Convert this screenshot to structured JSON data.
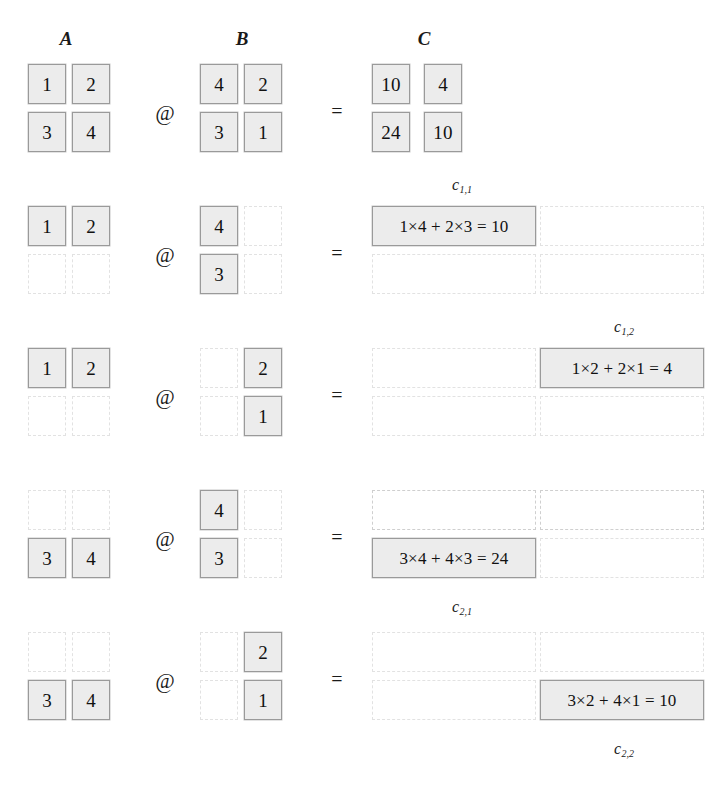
{
  "headers": {
    "a": "A",
    "b": "B",
    "c": "C"
  },
  "operators": {
    "matmul": "@",
    "equals": "="
  },
  "matrix_a": {
    "values": [
      [
        "1",
        "2"
      ],
      [
        "3",
        "4"
      ]
    ]
  },
  "matrix_b": {
    "values": [
      [
        "4",
        "2"
      ],
      [
        "3",
        "1"
      ]
    ]
  },
  "matrix_c": {
    "values": [
      [
        "10",
        "4"
      ],
      [
        "24",
        "10"
      ]
    ]
  },
  "colors": {
    "cell_fill": "#ececec",
    "cell_border": "#9a9a9a",
    "empty_border": "#e2e2e2",
    "text": "#111111",
    "background": "#ffffff"
  },
  "steps": [
    {
      "id": "full",
      "a": [
        [
          "1",
          "2"
        ],
        [
          "3",
          "4"
        ]
      ],
      "a_on": [
        [
          true,
          true
        ],
        [
          true,
          true
        ]
      ],
      "b": [
        [
          "4",
          "2"
        ],
        [
          "3",
          "1"
        ]
      ],
      "b_on": [
        [
          true,
          true
        ],
        [
          true,
          true
        ]
      ],
      "c": [
        [
          "10",
          "4"
        ],
        [
          "24",
          "10"
        ]
      ],
      "c_on": [
        [
          true,
          true
        ],
        [
          true,
          true
        ]
      ],
      "label": "",
      "label_sub": ""
    },
    {
      "id": "c11",
      "a": [
        [
          "1",
          "2"
        ],
        [
          "",
          ""
        ]
      ],
      "a_on": [
        [
          true,
          true
        ],
        [
          false,
          false
        ]
      ],
      "b": [
        [
          "4",
          ""
        ],
        [
          "3",
          ""
        ]
      ],
      "b_on": [
        [
          true,
          false
        ],
        [
          true,
          false
        ]
      ],
      "c": [
        [
          "1×4 + 2×3 = 10",
          ""
        ],
        [
          "",
          ""
        ]
      ],
      "c_on": [
        [
          true,
          false
        ],
        [
          false,
          false
        ]
      ],
      "label": "c",
      "label_sub": "1,1"
    },
    {
      "id": "c12",
      "a": [
        [
          "1",
          "2"
        ],
        [
          "",
          ""
        ]
      ],
      "a_on": [
        [
          true,
          true
        ],
        [
          false,
          false
        ]
      ],
      "b": [
        [
          "",
          "2"
        ],
        [
          "",
          "1"
        ]
      ],
      "b_on": [
        [
          false,
          true
        ],
        [
          false,
          true
        ]
      ],
      "c": [
        [
          "",
          "1×2 + 2×1 = 4"
        ],
        [
          "",
          ""
        ]
      ],
      "c_on": [
        [
          false,
          true
        ],
        [
          false,
          false
        ]
      ],
      "label": "c",
      "label_sub": "1,2"
    },
    {
      "id": "c21",
      "a": [
        [
          "",
          ""
        ],
        [
          "3",
          "4"
        ]
      ],
      "a_on": [
        [
          false,
          false
        ],
        [
          true,
          true
        ]
      ],
      "b": [
        [
          "4",
          ""
        ],
        [
          "3",
          ""
        ]
      ],
      "b_on": [
        [
          true,
          false
        ],
        [
          true,
          false
        ]
      ],
      "c": [
        [
          "",
          ""
        ],
        [
          "3×4 + 4×3 = 24",
          ""
        ]
      ],
      "c_on": [
        [
          false,
          false
        ],
        [
          true,
          false
        ]
      ],
      "label": "c",
      "label_sub": "2,1"
    },
    {
      "id": "c22",
      "a": [
        [
          "",
          ""
        ],
        [
          "3",
          "4"
        ]
      ],
      "a_on": [
        [
          false,
          false
        ],
        [
          true,
          true
        ]
      ],
      "b": [
        [
          "",
          "2"
        ],
        [
          "",
          "1"
        ]
      ],
      "b_on": [
        [
          false,
          true
        ],
        [
          false,
          true
        ]
      ],
      "c": [
        [
          "",
          ""
        ],
        [
          "",
          "3×2 + 4×1 = 10"
        ]
      ],
      "c_on": [
        [
          false,
          false
        ],
        [
          false,
          true
        ]
      ],
      "label": "c",
      "label_sub": "2,2"
    }
  ],
  "labels": [
    {
      "text": "c",
      "sub": "1,1",
      "x": 452,
      "y": 176
    },
    {
      "text": "c",
      "sub": "1,2",
      "x": 614,
      "y": 318
    },
    {
      "text": "c",
      "sub": "2,1",
      "x": 452,
      "y": 598
    },
    {
      "text": "c",
      "sub": "2,2",
      "x": 614,
      "y": 740
    }
  ],
  "geometry": {
    "a_x": [
      28,
      72
    ],
    "b_x": [
      200,
      244
    ],
    "c_x": [
      372,
      424
    ],
    "c_wide_x": [
      372,
      540
    ],
    "cell_w": 38,
    "cell_w_wide": 164,
    "cell_h": 40,
    "op_x": 148,
    "eq_x": 320,
    "row_tops": [
      64,
      206,
      348,
      490,
      632
    ],
    "row_gap": 48,
    "header_y": 28,
    "header_x": [
      48,
      224,
      406
    ]
  }
}
